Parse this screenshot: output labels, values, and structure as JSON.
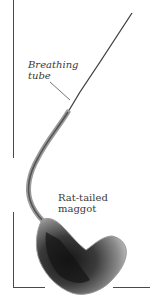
{
  "figure": {
    "labels": {
      "breathing_tube": [
        "Breathing",
        "tube"
      ],
      "maggot": [
        "Rat-tailed",
        "maggot"
      ]
    },
    "colors": {
      "background": "#ffffff",
      "frame": "#4a4a4a",
      "text": "#3a3a3a",
      "body_dark": "#1e1e1e",
      "body_mid": "#6a6a6a",
      "body_light": "#b0b0b0",
      "tube": "#5a5a5a"
    }
  }
}
